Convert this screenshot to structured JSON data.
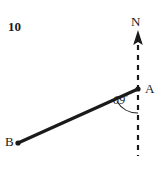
{
  "figure": {
    "question_number": "10",
    "background_color": "#ffffff",
    "stroke_color": "#1a1a1a",
    "labels": {
      "north": "N",
      "point_a": "A",
      "point_b": "B",
      "angle_value": "69",
      "angle_unit": "°",
      "angle_full": "69°"
    },
    "geometry": {
      "point_a": {
        "x": 138,
        "y": 89
      },
      "point_b": {
        "x": 18,
        "y": 143
      },
      "north_line_top": {
        "x": 138,
        "y": 32
      },
      "north_line_bottom": {
        "x": 138,
        "y": 156
      },
      "bearing_degrees": 69,
      "segment_label": "AB",
      "north_reference": "dashed vertical north line through A"
    },
    "style": {
      "segment_width_px": 3,
      "dashed_width_px": 2,
      "arc_width_px": 1
    }
  }
}
